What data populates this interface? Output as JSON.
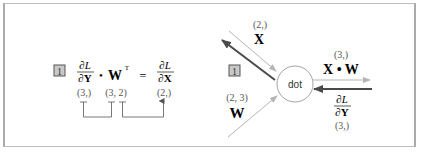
{
  "left_panel": {
    "step_badge": "1",
    "equation": {
      "lhs_fraction": {
        "numerator": "∂L",
        "denominator": "∂Y"
      },
      "dot_operator": "•",
      "matrix": "W",
      "transpose_mark": "T",
      "equals": "=",
      "rhs_fraction": {
        "numerator": "∂L",
        "denominator": "∂X"
      }
    },
    "shapes": {
      "dL_dY": "(3,)",
      "W_T": "(3, 2)",
      "dL_dX": "(2,)"
    }
  },
  "right_panel": {
    "node_label": "dot",
    "step_badge": "1",
    "input_x": {
      "shape": "(2,)",
      "label": "X"
    },
    "input_w": {
      "shape": "(2, 3)",
      "label": "W"
    },
    "output": {
      "shape": "(3,)",
      "label": "X • W"
    },
    "upstream_grad": {
      "numerator": "∂L",
      "denominator": "∂Y",
      "shape": "(3,)"
    }
  },
  "colors": {
    "forward_line": "#b5b5b5",
    "backward_arrow": "#4a4a4a",
    "badge_fill": "#c8c8c8",
    "badge_border": "#555555",
    "text": "#222222",
    "shape_text": "#555555"
  }
}
